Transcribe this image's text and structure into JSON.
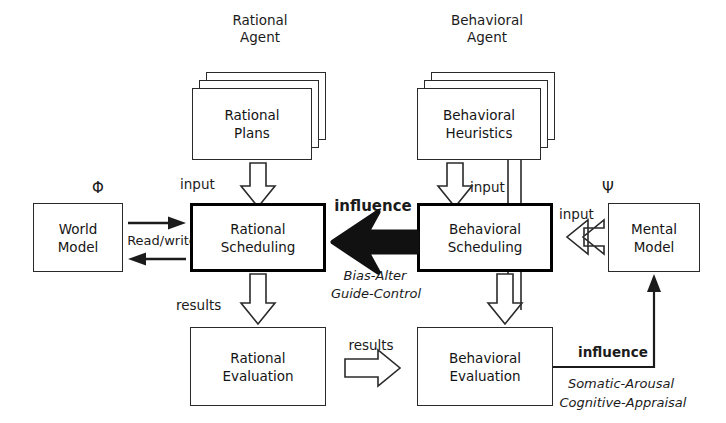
{
  "diagram": {
    "title_left": "Rational\nAgent",
    "title_right": "Behavioral\nAgent",
    "symbols": {
      "world": "Φ",
      "mental": "Ψ"
    },
    "nodes": {
      "rational_plans": "Rational\nPlans",
      "behavioral_heuristics": "Behavioral\nHeuristics",
      "world_model": "World\nModel",
      "mental_model": "Mental\nModel",
      "rational_scheduling": "Rational\nScheduling",
      "behavioral_scheduling": "Behavioral\nScheduling",
      "rational_evaluation": "Rational\nEvaluation",
      "behavioral_evaluation": "Behavioral\nEvaluation"
    },
    "edge_labels": {
      "input_rational": "input",
      "input_behavioral": "input",
      "input_mental": "input",
      "read_write": "Read/write",
      "results_rational": "results",
      "results_transfer": "results",
      "influence_top": "influence",
      "influence_bottom": "influence",
      "bias_alter": "Bias-Alter",
      "guide_control": "Guide-Control",
      "somatic_arousal": "Somatic-Arousal",
      "cognitive_appraisal": "Cognitive-Appraisal"
    },
    "colors": {
      "ink": "#141414",
      "stroke": "#2a2a2a",
      "emphasis": "#000000",
      "paper": "#ffffff"
    }
  }
}
